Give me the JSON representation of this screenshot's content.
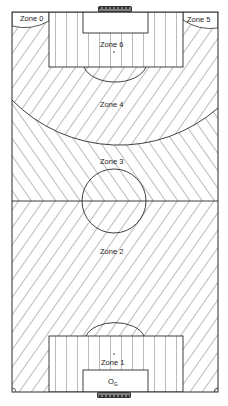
{
  "diagram": {
    "type": "football-pitch-zones",
    "colors": {
      "line": "#2a2a2a",
      "hatch": "#555555",
      "background": "#ffffff"
    },
    "zones": [
      {
        "id": "zone1",
        "label": "Zone 1",
        "hatch": "vertical"
      },
      {
        "id": "zone2",
        "label": "Zone 2",
        "hatch": "diagonal-forward"
      },
      {
        "id": "zone3",
        "label": "Zone 3",
        "hatch": "diagonal-back"
      },
      {
        "id": "zone4",
        "label": "Zone 4",
        "hatch": "diagonal-forward"
      },
      {
        "id": "zone5",
        "label": "Zone 5",
        "hatch": "diagonal-forward"
      },
      {
        "id": "zone6",
        "label": "Zone 6",
        "hatch": "vertical"
      },
      {
        "id": "zone0",
        "label": "Zone 0",
        "hatch": "diagonal-forward"
      }
    ],
    "goalkeeper_label": "G",
    "goalkeeper_prefix": "O",
    "goalkeeper_marker": "OG"
  }
}
